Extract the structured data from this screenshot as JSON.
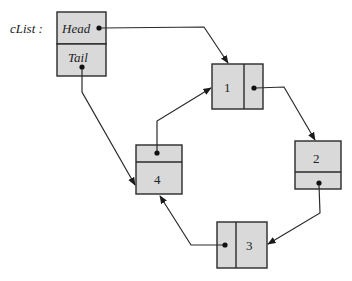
{
  "diagram": {
    "type": "circular-linked-list",
    "list_name": "cList :",
    "header": {
      "head_label": "Head",
      "tail_label": "Tail"
    },
    "nodes": [
      {
        "id": "1",
        "value": "1"
      },
      {
        "id": "2",
        "value": "2"
      },
      {
        "id": "3",
        "value": "3"
      },
      {
        "id": "4",
        "value": "4"
      }
    ],
    "edges": [
      {
        "from": "cList.Head",
        "to": "1"
      },
      {
        "from": "cList.Tail",
        "to": "4"
      },
      {
        "from": "1",
        "to": "2"
      },
      {
        "from": "2",
        "to": "3"
      },
      {
        "from": "3",
        "to": "4"
      },
      {
        "from": "4",
        "to": "1"
      }
    ],
    "colors": {
      "node_fill": "#d9d9d9",
      "stroke": "#2a2a2a"
    }
  }
}
